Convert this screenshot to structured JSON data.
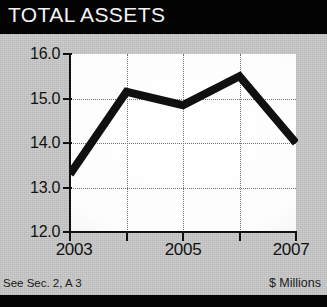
{
  "title": "TOTAL ASSETS",
  "footer": {
    "left_note": "See Sec. 2, A 3",
    "right_note": "$ Millions"
  },
  "colors": {
    "title_band": "#030303",
    "title_text": "#f2f2f2",
    "page_background": "#c9c9c9",
    "plot_background": "#fbfbfb",
    "axis": "#101010",
    "grid": "#6e6e6e",
    "series_line": "#101010"
  },
  "chart_data": {
    "type": "line",
    "title": "TOTAL ASSETS",
    "subtitle": "",
    "xlabel": "",
    "ylabel": "$ Millions",
    "x": [
      2003,
      2004,
      2005,
      2006,
      2007
    ],
    "categories": [
      "2003",
      "2004",
      "2005",
      "2006",
      "2007"
    ],
    "values": [
      13.3,
      15.15,
      14.85,
      15.5,
      14.0
    ],
    "series": [
      {
        "name": "Total Assets",
        "values": [
          13.3,
          15.15,
          14.85,
          15.5,
          14.0
        ]
      }
    ],
    "xlim": [
      2003,
      2007
    ],
    "ylim": [
      12.0,
      16.0
    ],
    "ytick_labels": [
      "16.0",
      "15.0",
      "14.0",
      "13.0",
      "12.0"
    ],
    "ytick_values": [
      16.0,
      15.0,
      14.0,
      13.0,
      12.0
    ],
    "xtick_values": [
      2003,
      2004,
      2005,
      2006,
      2007
    ],
    "xtick_labels": [
      "2003",
      "",
      "2005",
      "",
      "2007"
    ],
    "xtick_labels_shown": [
      "2003",
      "2005",
      "2007"
    ],
    "grid": true,
    "grid_style": "dotted",
    "legend": false,
    "legend_position": "none",
    "annotations": [
      "See Sec. 2, A 3",
      "$ Millions"
    ]
  }
}
